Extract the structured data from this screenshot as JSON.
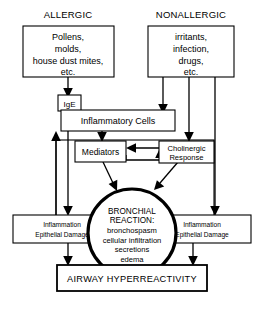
{
  "diagram": {
    "colors": {
      "background": "#ffffff",
      "stroke": "#000000",
      "fill": "#ffffff"
    },
    "headers": {
      "allergic": "ALLERGIC",
      "nonallergic": "NONALLERGIC"
    },
    "nodes": {
      "allergic_sources": {
        "lines": [
          "Pollens,",
          "molds,",
          "house dust mites,",
          "etc."
        ]
      },
      "nonallergic_sources": {
        "lines": [
          "irritants,",
          "infection,",
          "drugs,",
          "etc."
        ]
      },
      "ige": {
        "label": "IgE"
      },
      "inflammatory_cells": {
        "label": "Inflammatory Cells"
      },
      "mediators": {
        "label": "Mediators"
      },
      "cholinergic_response": {
        "lines": [
          "Cholinergic",
          "Response"
        ]
      },
      "bronchial_reaction": {
        "lines": [
          "BRONCHIAL",
          "REACTION:",
          "bronchospasm",
          "cellular infiltration",
          "secretions",
          "edema"
        ]
      },
      "inflammation_left": {
        "lines": [
          "Inflammation",
          "Epithelial Damage"
        ]
      },
      "inflammation_right": {
        "lines": [
          "Inflammation",
          "Epithelial Damage"
        ]
      },
      "airway_hyperreactivity": {
        "label": "AIRWAY HYPERREACTIVITY"
      }
    }
  }
}
